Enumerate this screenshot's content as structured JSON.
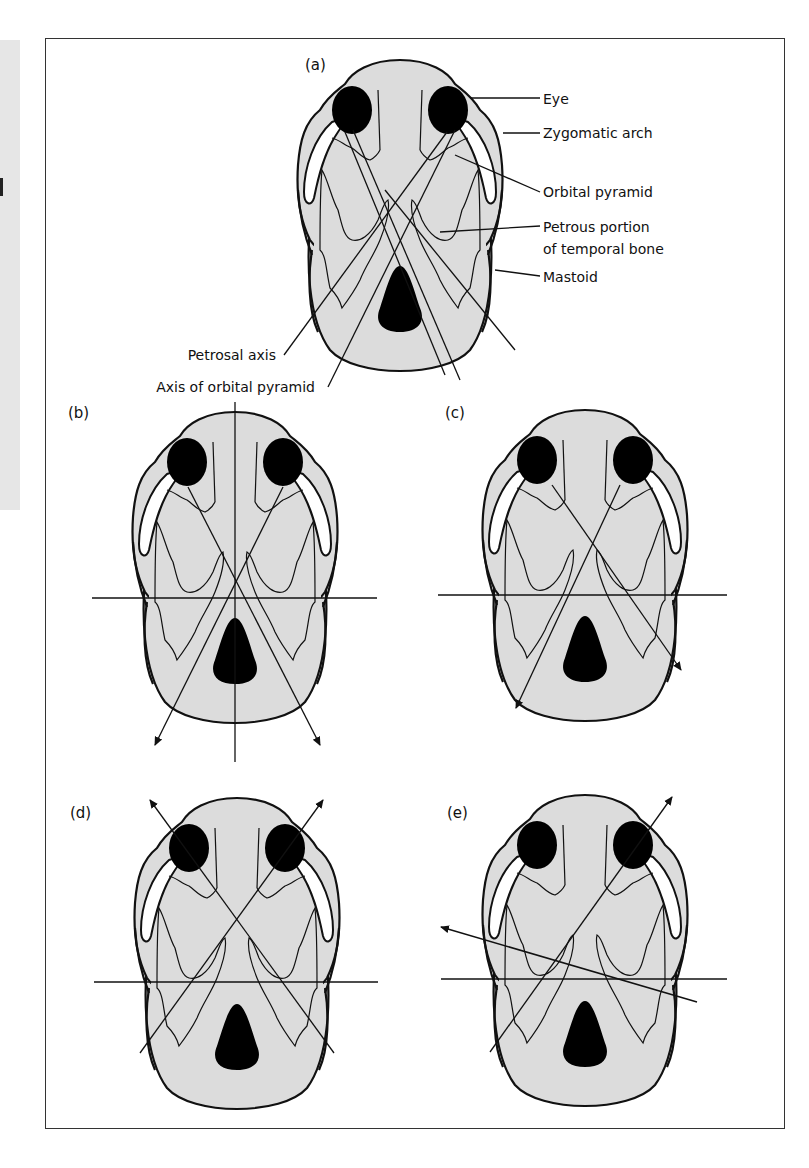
{
  "figure": {
    "panels": [
      {
        "id": "a",
        "label": "(a)",
        "cx": 400,
        "top": 60
      },
      {
        "id": "b",
        "label": "(b)",
        "cx": 235,
        "top": 412
      },
      {
        "id": "c",
        "label": "(c)",
        "cx": 585,
        "top": 410
      },
      {
        "id": "d",
        "label": "(d)",
        "cx": 237,
        "top": 798
      },
      {
        "id": "e",
        "label": "(e)",
        "cx": 585,
        "top": 795
      }
    ],
    "annotations": {
      "eye": "Eye",
      "zygomatic_arch": "Zygomatic arch",
      "orbital_pyramid": "Orbital pyramid",
      "petrous_line1": "Petrous portion",
      "petrous_line2": "of temporal bone",
      "mastoid": "Mastoid",
      "petrosal_axis": "Petrosal axis",
      "axis_orbital_pyramid": "Axis of orbital pyramid"
    },
    "colors": {
      "skull_fill": "#dcdcdc",
      "outline": "#111111",
      "eye_fill": "#000000",
      "frame": "#333333"
    }
  }
}
